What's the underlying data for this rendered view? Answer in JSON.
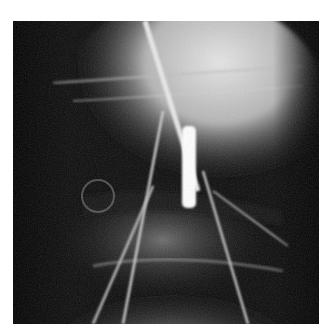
{
  "image": {
    "kind": "radiograph",
    "description": "Grayscale X-ray of a joint with radiopaque wires/needles converging toward a bright vertical marker at center",
    "background": "#ffffff",
    "frame_color": "#050505",
    "tones": {
      "dark": "#050505",
      "mid": "#6a6a6a",
      "light": "#cfcfcf",
      "bright": "#ffffff"
    }
  }
}
